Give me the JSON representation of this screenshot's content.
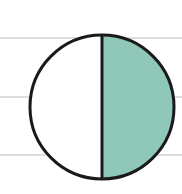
{
  "diagram": {
    "fraction_shaded": "1/2",
    "parts_total": 2,
    "parts_shaded": 1,
    "colors": {
      "shade": "#8fc7b8",
      "outline": "#1a1a1a",
      "rule_lines": "#bdbdbd",
      "background": "#ffffff"
    },
    "rule_lines_y": [
      38,
      97,
      155
    ],
    "circle": {
      "cx": 102,
      "cy": 107,
      "r": 72
    }
  }
}
